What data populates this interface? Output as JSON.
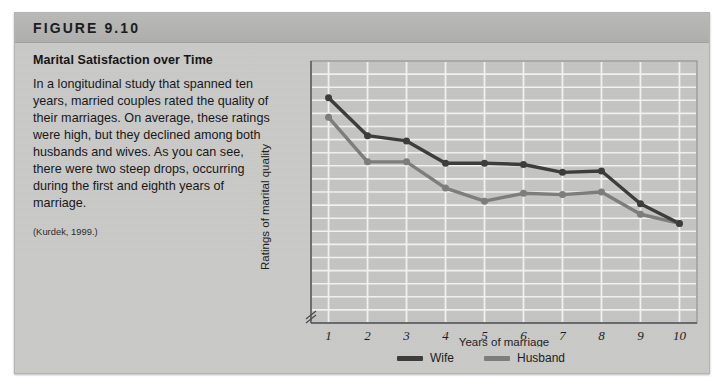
{
  "figure": {
    "number_label": "FIGURE 9.10",
    "title": "Marital Satisfaction over Time",
    "body": "In a longitudinal study that spanned ten years, married couples rated the quality of their marriages. On average, these ratings were high, but they declined among both husbands and wives. As you can see, there were two steep drops, occurring during the first and eighth years of marriage.",
    "citation": "(Kurdek, 1999.)"
  },
  "colors": {
    "wife_line": "#3c3c3c",
    "husband_line": "#7d7d7b",
    "panel_bg": "#c9c9c7",
    "plot_bg": "#c4c4c2",
    "gridline": "#f2f2f0",
    "axis": "#55555a",
    "header_band": "#b3b3b1"
  },
  "chart_data": {
    "type": "line",
    "title": "Marital Satisfaction over Time",
    "xlabel": "Years of marriage",
    "ylabel": "Ratings of marital quality",
    "x": [
      1,
      2,
      3,
      4,
      5,
      6,
      7,
      8,
      9,
      10
    ],
    "xtick_labels": [
      "1",
      "2",
      "3",
      "4",
      "5",
      "6",
      "7",
      "8",
      "9",
      "10"
    ],
    "ytick_labels": [],
    "xlim": [
      0.55,
      10.45
    ],
    "ylim": [
      0,
      20
    ],
    "grid": true,
    "y_axis_break": true,
    "legend_position": "bottom-center",
    "series": [
      {
        "name": "Wife",
        "color": "#3c3c3c",
        "values": [
          17.2,
          14.3,
          13.9,
          12.2,
          12.2,
          12.1,
          11.5,
          11.6,
          9.1,
          7.6
        ]
      },
      {
        "name": "Husband",
        "color": "#7d7d7b",
        "values": [
          15.7,
          12.3,
          12.3,
          10.3,
          9.3,
          9.9,
          9.8,
          10.0,
          8.3,
          7.6
        ]
      }
    ]
  },
  "legend": {
    "items": [
      {
        "label": "Wife"
      },
      {
        "label": "Husband"
      }
    ]
  }
}
